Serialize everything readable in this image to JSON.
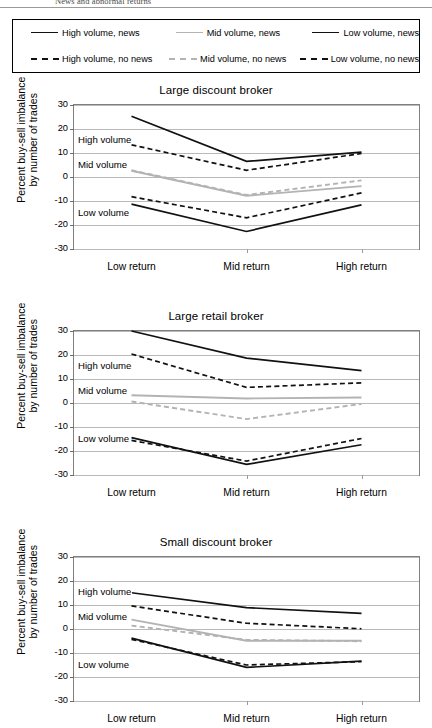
{
  "running_head": "News and abnormal returns",
  "legend": {
    "rows": [
      [
        {
          "label": "High volume, news",
          "style": "solid",
          "color": "#111111"
        },
        {
          "label": "Mid volume, news",
          "style": "solid",
          "color": "#b3b3b3"
        },
        {
          "label": "Low volume, news",
          "style": "solid",
          "color": "#111111"
        }
      ],
      [
        {
          "label": "High volume, no news",
          "style": "dashed",
          "color": "#111111"
        },
        {
          "label": "Mid volume, no news",
          "style": "dashed",
          "color": "#b3b3b3"
        },
        {
          "label": "Low volume, no news",
          "style": "dashed",
          "color": "#111111"
        }
      ]
    ]
  },
  "axis": {
    "ylabel_line1": "Percent buy-sell imbalance",
    "ylabel_line2": "by number of trades",
    "yticks": [
      30,
      20,
      10,
      0,
      -10,
      -20,
      -30
    ],
    "ylim": [
      -30,
      30
    ],
    "categories": [
      "Low return",
      "Mid return",
      "High return"
    ]
  },
  "annotations": {
    "high": "High volume",
    "mid": "Mid volume",
    "low": "Low volume"
  },
  "chart_data": [
    {
      "type": "line",
      "title": "Large discount broker",
      "xlabel": "",
      "ylabel": "Percent buy-sell imbalance by number of trades",
      "categories": [
        "Low return",
        "Mid return",
        "High return"
      ],
      "ylim": [
        -30,
        30
      ],
      "yticks": [
        30,
        20,
        10,
        0,
        -10,
        -20,
        -30
      ],
      "grid": true,
      "legend_position": "top-external",
      "annotations": [
        "High volume",
        "Mid volume",
        "Low volume"
      ],
      "series": [
        {
          "name": "High volume, news",
          "style": "solid",
          "color": "#111111",
          "values": [
            25.3,
            6.5,
            10.4
          ]
        },
        {
          "name": "High volume, no news",
          "style": "dashed",
          "color": "#111111",
          "values": [
            13.4,
            2.8,
            9.8
          ]
        },
        {
          "name": "Mid volume, news",
          "style": "solid",
          "color": "#b3b3b3",
          "values": [
            2.6,
            -7.8,
            -3.8
          ]
        },
        {
          "name": "Mid volume, no news",
          "style": "dashed",
          "color": "#b3b3b3",
          "values": [
            2.8,
            -7.5,
            -1.4
          ]
        },
        {
          "name": "Low volume, news",
          "style": "solid",
          "color": "#111111",
          "values": [
            -11.3,
            -22.7,
            -11.6
          ]
        },
        {
          "name": "Low volume, no news",
          "style": "dashed",
          "color": "#111111",
          "values": [
            -8.2,
            -17.0,
            -6.6
          ]
        }
      ]
    },
    {
      "type": "line",
      "title": "Large retail broker",
      "xlabel": "",
      "ylabel": "Percent buy-sell imbalance by number of trades",
      "categories": [
        "Low return",
        "Mid return",
        "High return"
      ],
      "ylim": [
        -30,
        30
      ],
      "yticks": [
        30,
        20,
        10,
        0,
        -10,
        -20,
        -30
      ],
      "grid": true,
      "legend_position": "top-external",
      "annotations": [
        "High volume",
        "Mid volume",
        "Low volume"
      ],
      "series": [
        {
          "name": "High volume, news",
          "style": "solid",
          "color": "#111111",
          "values": [
            30.0,
            18.7,
            13.5
          ]
        },
        {
          "name": "High volume, no news",
          "style": "dashed",
          "color": "#111111",
          "values": [
            20.4,
            6.5,
            8.4
          ]
        },
        {
          "name": "Mid volume, news",
          "style": "solid",
          "color": "#b3b3b3",
          "values": [
            3.2,
            1.9,
            2.3
          ]
        },
        {
          "name": "Mid volume, no news",
          "style": "dashed",
          "color": "#b3b3b3",
          "values": [
            0.6,
            -6.7,
            -0.4
          ]
        },
        {
          "name": "Low volume, news",
          "style": "solid",
          "color": "#111111",
          "values": [
            -14.4,
            -25.6,
            -17.4
          ]
        },
        {
          "name": "Low volume, no news",
          "style": "dashed",
          "color": "#111111",
          "values": [
            -15.6,
            -24.2,
            -14.8
          ]
        }
      ]
    },
    {
      "type": "line",
      "title": "Small discount broker",
      "xlabel": "",
      "ylabel": "Percent buy-sell imbalance by number of trades",
      "categories": [
        "Low return",
        "Mid return",
        "High return"
      ],
      "ylim": [
        -30,
        30
      ],
      "yticks": [
        30,
        20,
        10,
        0,
        -10,
        -20,
        -30
      ],
      "grid": true,
      "legend_position": "top-external",
      "annotations": [
        "High volume",
        "Mid volume",
        "Low volume"
      ],
      "series": [
        {
          "name": "High volume, news",
          "style": "solid",
          "color": "#111111",
          "values": [
            15.1,
            8.9,
            6.5
          ]
        },
        {
          "name": "High volume, no news",
          "style": "dashed",
          "color": "#111111",
          "values": [
            9.6,
            2.4,
            0.1
          ]
        },
        {
          "name": "Mid volume, news",
          "style": "solid",
          "color": "#b3b3b3",
          "values": [
            3.9,
            -4.9,
            -4.9
          ]
        },
        {
          "name": "Mid volume, no news",
          "style": "dashed",
          "color": "#b3b3b3",
          "values": [
            1.4,
            -4.5,
            -5.1
          ]
        },
        {
          "name": "Low volume, news",
          "style": "solid",
          "color": "#111111",
          "values": [
            -3.8,
            -16.0,
            -13.4
          ]
        },
        {
          "name": "Low volume, no news",
          "style": "dashed",
          "color": "#111111",
          "values": [
            -4.3,
            -15.0,
            -13.6
          ]
        }
      ]
    }
  ]
}
